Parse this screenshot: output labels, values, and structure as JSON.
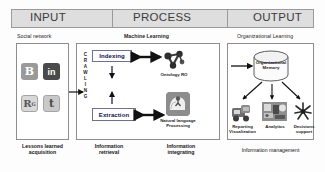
{
  "header": {
    "sections": [
      {
        "label": "INPUT"
      },
      {
        "label": "PROCESS"
      },
      {
        "label": "OUTPUT"
      }
    ],
    "background_color": "#dedede",
    "border_color": "#9a9a9a"
  },
  "subtitles": {
    "input": "Social network",
    "process": "Machine Learning",
    "output": "Organizational Learning"
  },
  "input_panel": {
    "icons": [
      {
        "name": "blogger-icon",
        "glyph": "B",
        "label": "Blogger"
      },
      {
        "name": "linkedin-icon",
        "glyph": "in",
        "label": "LinkedIn"
      },
      {
        "name": "researchgate-icon",
        "glyph": "R",
        "superscript": "G",
        "label": "ResearchGate"
      },
      {
        "name": "twitter-icon",
        "glyph": "t",
        "label": "Twitter"
      }
    ],
    "caption_line1": "Lessons learned",
    "caption_line2": "acquisition"
  },
  "process_panel": {
    "crawling_label": "CRAWLING",
    "crawling_letters": [
      "C",
      "R",
      "A",
      "W",
      "L",
      "I",
      "N",
      "G"
    ],
    "boxes": [
      {
        "name": "indexing-box",
        "label": "Indexing"
      },
      {
        "name": "extraction-box",
        "label": "Extraction"
      }
    ],
    "icons": [
      {
        "name": "ontology-graph-icon",
        "label": "Ontology RO"
      },
      {
        "name": "natural-language-processing-icon",
        "label_line1": "Natural language",
        "label_line2": "Processing"
      }
    ],
    "caption_left_line1": "Information",
    "caption_left_line2": "retrieval",
    "caption_right_line1": "Information",
    "caption_right_line2": "integrating"
  },
  "output_panel": {
    "memory": {
      "name": "organizational-memory-cylinder",
      "label_line1": "Organizational",
      "label_line2": "Memory"
    },
    "items": [
      {
        "name": "reporting-visualization-item",
        "label_line1": "Reporting",
        "label_line2": "Visualization"
      },
      {
        "name": "analytics-item",
        "label_line1": "Analytics",
        "label_line2": ""
      },
      {
        "name": "decisions-support-item",
        "label_line1": "Decisions",
        "label_line2": "support"
      }
    ],
    "caption": "Information management"
  },
  "colors": {
    "panel_border": "#8e8e8e",
    "box_border": "#6f6f8e",
    "box_text": "#10104a",
    "arrow": "#111111",
    "page_background": "#fdfdfd"
  }
}
